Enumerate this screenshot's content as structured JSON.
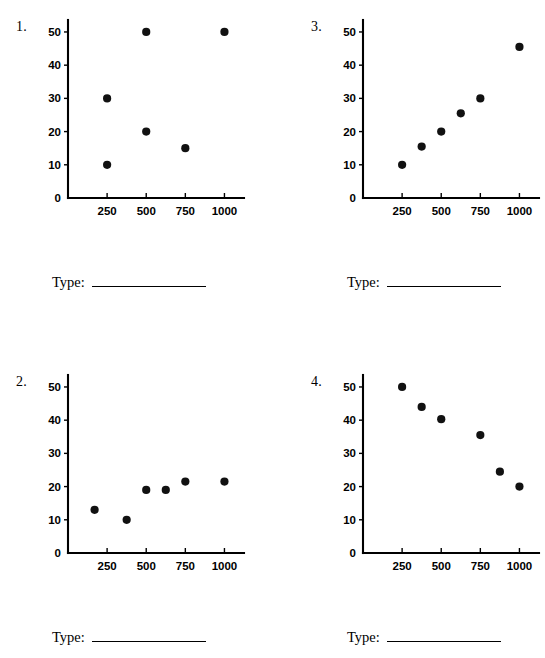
{
  "page": {
    "background_color": "#ffffff",
    "ink_color": "#000000"
  },
  "answer_prompt": {
    "label": "Type:",
    "blank_value": ""
  },
  "problems": [
    {
      "number": "1.",
      "position": "top-left",
      "type_label": "Type:",
      "chart_data": {
        "type": "scatter",
        "title": "",
        "xlabel": "",
        "ylabel": "",
        "xlim": [
          0,
          1125
        ],
        "ylim": [
          0,
          53
        ],
        "xticks": [
          250,
          500,
          750,
          1000
        ],
        "xtick_labels": [
          "250",
          "500",
          "750",
          "1000"
        ],
        "yticks": [
          0,
          10,
          20,
          30,
          40,
          50
        ],
        "ytick_labels": [
          "0",
          "10",
          "20",
          "30",
          "40",
          "50"
        ],
        "grid": false,
        "legend": "none",
        "series": [
          {
            "name": "points",
            "x": [
              250,
              250,
              500,
              500,
              750,
              1000
            ],
            "y": [
              30,
              10,
              50,
              20,
              15,
              50
            ]
          }
        ]
      }
    },
    {
      "number": "3.",
      "position": "top-right",
      "type_label": "Type:",
      "chart_data": {
        "type": "scatter",
        "title": "",
        "xlabel": "",
        "ylabel": "",
        "xlim": [
          0,
          1125
        ],
        "ylim": [
          0,
          53
        ],
        "xticks": [
          250,
          500,
          750,
          1000
        ],
        "xtick_labels": [
          "250",
          "500",
          "750",
          "1000"
        ],
        "yticks": [
          0,
          10,
          20,
          30,
          40,
          50
        ],
        "ytick_labels": [
          "0",
          "10",
          "20",
          "30",
          "40",
          "50"
        ],
        "grid": false,
        "legend": "none",
        "series": [
          {
            "name": "points",
            "x": [
              250,
              375,
              500,
              625,
              750,
              1000
            ],
            "y": [
              10,
              15.5,
              20,
              25.5,
              30,
              45.5
            ]
          }
        ]
      }
    },
    {
      "number": "2.",
      "position": "bottom-left",
      "type_label": "Type:",
      "chart_data": {
        "type": "scatter",
        "title": "",
        "xlabel": "",
        "ylabel": "",
        "xlim": [
          0,
          1125
        ],
        "ylim": [
          0,
          53
        ],
        "xticks": [
          250,
          500,
          750,
          1000
        ],
        "xtick_labels": [
          "250",
          "500",
          "750",
          "1000"
        ],
        "yticks": [
          0,
          10,
          20,
          30,
          40,
          50
        ],
        "ytick_labels": [
          "0",
          "10",
          "20",
          "30",
          "40",
          "50"
        ],
        "grid": false,
        "legend": "none",
        "series": [
          {
            "name": "points",
            "x": [
              170,
              375,
              500,
              625,
              750,
              1000
            ],
            "y": [
              13,
              10,
              19,
              19,
              21.5,
              21.5
            ]
          }
        ]
      }
    },
    {
      "number": "4.",
      "position": "bottom-right",
      "type_label": "Type:",
      "chart_data": {
        "type": "scatter",
        "title": "",
        "xlabel": "",
        "ylabel": "",
        "xlim": [
          0,
          1125
        ],
        "ylim": [
          0,
          53
        ],
        "xticks": [
          250,
          500,
          750,
          1000
        ],
        "xtick_labels": [
          "250",
          "500",
          "750",
          "1000"
        ],
        "yticks": [
          0,
          10,
          20,
          30,
          40,
          50
        ],
        "ytick_labels": [
          "0",
          "10",
          "20",
          "30",
          "40",
          "50"
        ],
        "grid": false,
        "legend": "none",
        "series": [
          {
            "name": "points",
            "x": [
              250,
              375,
              500,
              750,
              875,
              1000
            ],
            "y": [
              50,
              44,
              40.3,
              35.5,
              24.5,
              20
            ]
          }
        ]
      }
    }
  ]
}
